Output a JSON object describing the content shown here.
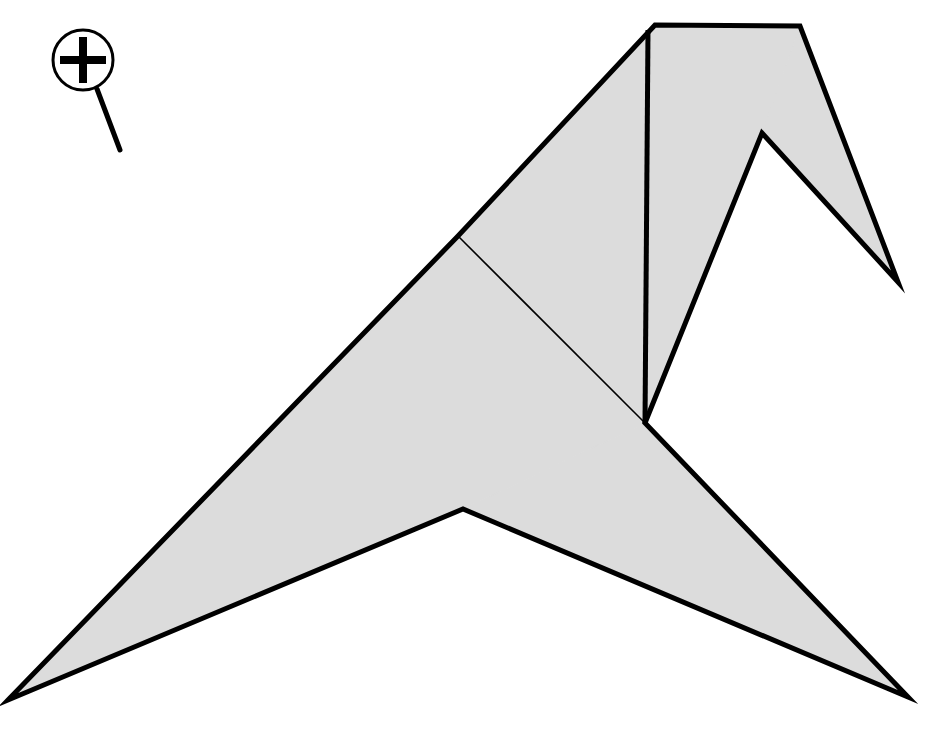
{
  "canvas": {
    "width": 931,
    "height": 732,
    "background_color": "#ffffff",
    "title": "origami-bird-diagram"
  },
  "style": {
    "fill_color": "#dcdcdc",
    "outline_color": "#000000",
    "outline_width": 5,
    "crease_color": "#000000",
    "crease_width": 1.6,
    "cursor_color": "#000000",
    "cursor_stroke_width": 4
  },
  "figure": {
    "name": "folded-paper-bird",
    "faces": [
      {
        "name": "left-wing-face",
        "points": "8,700 458,236 645,423 463,509"
      },
      {
        "name": "upper-body-face",
        "points": "458,236 655,25 648,30 645,423"
      },
      {
        "name": "head-panel-face",
        "points": "648,30 655,25 800,26 762,133 645,423"
      },
      {
        "name": "beak-face",
        "points": "800,26 898,282 762,133"
      },
      {
        "name": "tail-face",
        "points": "645,423 908,697 463,509"
      }
    ],
    "outline": {
      "name": "bird-outline",
      "points": "8,700 458,236 655,25 800,26 898,282 762,133 645,423 908,697 463,509"
    },
    "creases": [
      {
        "name": "crease-wing-fold",
        "x1": 458,
        "y1": 236,
        "x2": 645,
        "y2": 423,
        "weight": "thin"
      },
      {
        "name": "crease-body-vertical",
        "x1": 648,
        "y1": 30,
        "x2": 645,
        "y2": 423,
        "weight": "thick"
      },
      {
        "name": "crease-head-diagonal",
        "x1": 655,
        "y1": 25,
        "x2": 645,
        "y2": 423,
        "weight": "none"
      }
    ],
    "vertices": [
      {
        "name": "left-wing-tip",
        "x": 8,
        "y": 700
      },
      {
        "name": "wing-shoulder",
        "x": 458,
        "y": 236
      },
      {
        "name": "head-top-left",
        "x": 655,
        "y": 25
      },
      {
        "name": "head-top-right",
        "x": 800,
        "y": 26
      },
      {
        "name": "beak-tip",
        "x": 898,
        "y": 282
      },
      {
        "name": "beak-notch",
        "x": 762,
        "y": 133
      },
      {
        "name": "center-hub",
        "x": 645,
        "y": 423
      },
      {
        "name": "tail-tip",
        "x": 908,
        "y": 697
      },
      {
        "name": "tail-notch",
        "x": 463,
        "y": 509
      }
    ]
  },
  "cursor": {
    "name": "zoom-in-cursor",
    "icon": "magnifier-plus-icon",
    "circle": {
      "cx": 83,
      "cy": 60,
      "r": 30
    },
    "ring_width": 3,
    "plus": {
      "horizontal": {
        "x1": 60,
        "y1": 60,
        "x2": 106,
        "y2": 60
      },
      "vertical": {
        "x1": 83,
        "y1": 37,
        "x2": 83,
        "y2": 83
      },
      "thickness": 8
    },
    "handle": {
      "x1": 97,
      "y1": 89,
      "x2": 120,
      "y2": 150,
      "width": 5
    }
  }
}
